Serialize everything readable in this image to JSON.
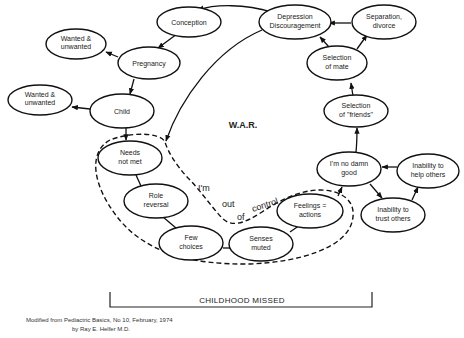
{
  "diagram": {
    "center_label": "W.A.R.",
    "nodes": {
      "conception": [
        "Conception"
      ],
      "depression": [
        "Depression",
        "Discouragement"
      ],
      "separation": [
        "Separation,",
        "divorce"
      ],
      "wanted1": [
        "Wanted &",
        "unwanted"
      ],
      "pregnancy": [
        "Pregnancy"
      ],
      "wanted2": [
        "Wanted &",
        "unwanted"
      ],
      "child": [
        "Child"
      ],
      "mate": [
        "Selection",
        "of mate"
      ],
      "friends": [
        "Selection",
        "of \"friends\""
      ],
      "needs": [
        "Needs",
        "not met"
      ],
      "role": [
        "Role",
        "reversal"
      ],
      "few": [
        "Few",
        "choices"
      ],
      "senses": [
        "Senses",
        "muted"
      ],
      "feelings": [
        "Feelings =",
        "actions"
      ],
      "nodamn": [
        "I'm no damn",
        "good"
      ],
      "help": [
        "Inability to",
        "help others"
      ],
      "trust": [
        "Inability to",
        "trust others"
      ]
    },
    "handwritten": {
      "im": "I'm",
      "out": "out",
      "of": "of",
      "control": "control"
    },
    "bracket_label": "CHILDHOOD MISSED"
  },
  "caption": {
    "line1": "Modified from Pediactric Basics, No 10, February, 1974",
    "line2": "by Ray E. Helfer  M.D."
  }
}
